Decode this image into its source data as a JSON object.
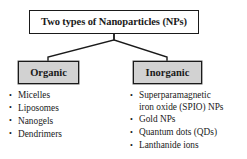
{
  "diagram": {
    "type": "tree-hierarchy",
    "root": {
      "label": "Two types of Nanoparticles (NPs)"
    },
    "branches": [
      {
        "id": "organic",
        "label": "Organic",
        "items": [
          "Micelles",
          "Liposomes",
          "Nanogels",
          "Dendrimers"
        ]
      },
      {
        "id": "inorganic",
        "label": "Inorganic",
        "items": [
          "Superparamagnetic\niron oxide (SPIO) NPs",
          "Gold NPs",
          "Quantum dots (QDs)",
          "Lanthanide ions"
        ]
      }
    ],
    "colors": {
      "background": "#ffffff",
      "box_border": "#1a1a1a",
      "root_fill": "#ffffff",
      "category_fill": "#d2d2d2",
      "text": "#1a1a1a",
      "connector": "#1a1a1a"
    }
  }
}
